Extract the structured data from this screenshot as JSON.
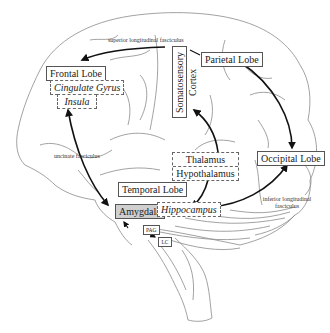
{
  "diagram": {
    "type": "brain-anatomy-pathways",
    "regions": {
      "frontal_lobe": "Frontal Lobe",
      "cingulate_gyrus": "Cingulate Gyrus",
      "insula": "Insula",
      "somatosensory_cortex": "Somatosensory Cortex",
      "parietal_lobe": "Parietal Lobe",
      "thalamus": "Thalamus",
      "hypothalamus": "Hypothalamus",
      "occipital_lobe": "Occipital Lobe",
      "temporal_lobe": "Temporal Lobe",
      "amygdala": "Amygdala",
      "hippocampus": "Hippocampus",
      "pag": "PAG",
      "lc": "LC"
    },
    "tracts": {
      "superior_longitudinal": "superior longitudinal fasciculus",
      "uncinate": "uncinate fasciculus",
      "inferior_longitudinal_line1": "inferior longitudinal",
      "inferior_longitudinal_line2": "fasciculus"
    },
    "connections": [
      {
        "from": "Somatosensory Cortex",
        "to": "Frontal Lobe",
        "label": "superior longitudinal fasciculus"
      },
      {
        "from": "Parietal Lobe",
        "to": "Occipital Lobe"
      },
      {
        "from": "Amygdala",
        "to": "Insula",
        "label": "uncinate fasciculus",
        "bidirectional": true
      },
      {
        "from": "Thalamus",
        "to": "Somatosensory Cortex"
      },
      {
        "from": "Hypothalamus",
        "to": "Hippocampus"
      },
      {
        "from": "Occipital Lobe",
        "to": "Hippocampus",
        "label": "inferior longitudinal fasciculus",
        "bidirectional": true
      },
      {
        "from": "PAG",
        "to": "Amygdala"
      },
      {
        "from": "PAG",
        "to": "LC"
      }
    ],
    "colors": {
      "outline": "#888888",
      "arrow": "#111111",
      "amygdala_fill": "#cfcfcf"
    }
  }
}
